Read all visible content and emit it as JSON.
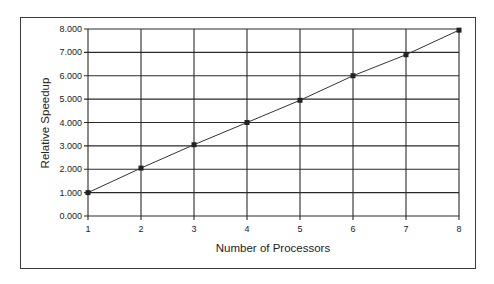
{
  "chart_data": {
    "type": "line",
    "title": "",
    "xlabel": "Number of Processors",
    "ylabel": "Relative Speedup",
    "x": [
      1,
      2,
      3,
      4,
      5,
      6,
      7,
      8
    ],
    "series": [
      {
        "name": "Relative Speedup",
        "values": [
          1.0,
          2.05,
          3.05,
          4.0,
          4.95,
          6.0,
          6.9,
          7.95
        ],
        "marker": "square",
        "color": "#333333"
      }
    ],
    "x_ticks": [
      "1",
      "2",
      "3",
      "4",
      "5",
      "6",
      "7",
      "8"
    ],
    "y_ticks": [
      "0.000",
      "1.000",
      "2.000",
      "3.000",
      "4.000",
      "5.000",
      "6.000",
      "7.000",
      "8.000"
    ],
    "xlim": [
      1,
      8
    ],
    "ylim": [
      0,
      8
    ],
    "grid": true,
    "legend": "none"
  },
  "labels": {
    "xlabel": "Number of Processors",
    "ylabel": "Relative Speedup"
  }
}
